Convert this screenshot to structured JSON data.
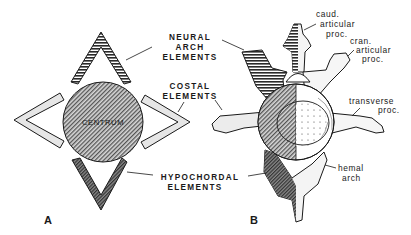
{
  "figure": {
    "panels": [
      {
        "id": "A",
        "label": "A"
      },
      {
        "id": "B",
        "label": "B"
      }
    ]
  },
  "panel_a": {
    "centrum_label": "CENTRUM",
    "labels": {
      "neural_arch": [
        "NEURAL",
        "ARCH",
        "ELEMENTS"
      ],
      "costal": [
        "COSTAL",
        "ELEMENTS"
      ],
      "hypochordal": [
        "HYPOCHORDAL",
        "ELEMENTS"
      ]
    }
  },
  "panel_b": {
    "labels": {
      "caud_articular": [
        "caud.",
        "articular",
        "proc."
      ],
      "cran_articular": [
        "cran.",
        "articular",
        "proc."
      ],
      "transverse": [
        "transverse",
        "proc."
      ],
      "hemal_arch": [
        "hemal",
        "arch"
      ]
    }
  },
  "colors": {
    "ink": "#1a1a1a",
    "light_fill": "#e4e4e4",
    "dark_fill": "#6a6a6a",
    "background": "#ffffff"
  }
}
